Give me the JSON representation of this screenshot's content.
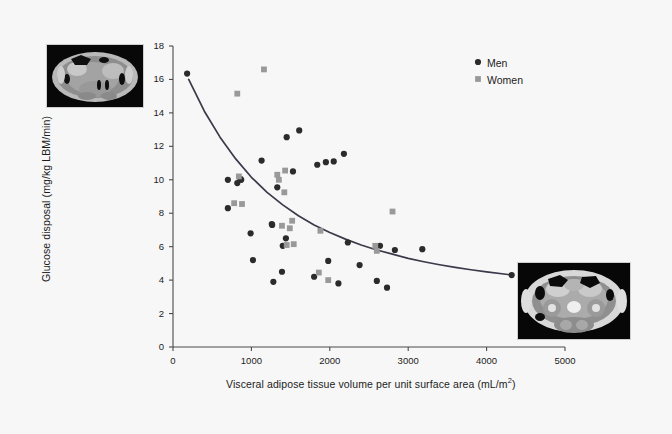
{
  "figure": {
    "background": "#f7f7f7",
    "men_color": "#2b2b2b",
    "women_color": "#999999",
    "curve_color": "#3a3a4a"
  },
  "images": [
    {
      "name": "ct-scan-abdominal-top",
      "caption": ""
    },
    {
      "name": "ct-scan-abdominal-bottom",
      "caption": ""
    }
  ],
  "chart_data": {
    "type": "scatter",
    "title": "",
    "xlabel_text": "Visceral adipose tissue volume per unit surface area (mL/m",
    "xlabel_sup": "2",
    "xlabel_tail": ")",
    "ylabel": "Glucose disposal (mg/kg LBM/min)",
    "xlim": [
      0,
      5000
    ],
    "ylim": [
      0,
      18
    ],
    "xticks": [
      0,
      1000,
      2000,
      3000,
      4000,
      5000
    ],
    "yticks": [
      0,
      2,
      4,
      6,
      8,
      10,
      12,
      14,
      16,
      18
    ],
    "xtick_labels": [
      "0",
      "1000",
      "2000",
      "3000",
      "4000",
      "5000"
    ],
    "ytick_labels": [
      "0",
      "2",
      "4",
      "6",
      "8",
      "10",
      "12",
      "14",
      "16",
      "18"
    ],
    "grid": false,
    "legend_position": "top-right",
    "series": [
      {
        "name": "Men",
        "marker": "circle",
        "color": "#2b2b2b",
        "points": [
          [
            180,
            16.35
          ],
          [
            700,
            10.0
          ],
          [
            700,
            8.3
          ],
          [
            820,
            9.8
          ],
          [
            860,
            10.05
          ],
          [
            870,
            10.0
          ],
          [
            990,
            6.8
          ],
          [
            1020,
            5.2
          ],
          [
            1130,
            11.15
          ],
          [
            1260,
            7.35
          ],
          [
            1265,
            7.3
          ],
          [
            1280,
            3.9
          ],
          [
            1330,
            9.55
          ],
          [
            1390,
            4.5
          ],
          [
            1400,
            6.05
          ],
          [
            1440,
            6.5
          ],
          [
            1450,
            12.55
          ],
          [
            1530,
            10.5
          ],
          [
            1610,
            12.95
          ],
          [
            1800,
            4.2
          ],
          [
            1840,
            10.9
          ],
          [
            1950,
            11.05
          ],
          [
            1980,
            5.15
          ],
          [
            2050,
            11.1
          ],
          [
            2110,
            3.8
          ],
          [
            2180,
            11.55
          ],
          [
            2230,
            6.25
          ],
          [
            2380,
            4.9
          ],
          [
            2600,
            3.95
          ],
          [
            2640,
            6.05
          ],
          [
            2730,
            3.55
          ],
          [
            2830,
            5.8
          ],
          [
            3180,
            5.85
          ],
          [
            4320,
            4.3
          ]
        ]
      },
      {
        "name": "Women",
        "marker": "square",
        "color": "#999999",
        "points": [
          [
            780,
            8.6
          ],
          [
            820,
            15.15
          ],
          [
            840,
            10.2
          ],
          [
            880,
            8.55
          ],
          [
            1160,
            16.6
          ],
          [
            1330,
            10.3
          ],
          [
            1350,
            10.0
          ],
          [
            1390,
            7.25
          ],
          [
            1420,
            9.25
          ],
          [
            1430,
            10.55
          ],
          [
            1450,
            6.1
          ],
          [
            1490,
            7.1
          ],
          [
            1520,
            7.55
          ],
          [
            1540,
            6.15
          ],
          [
            1880,
            6.95
          ],
          [
            1860,
            4.45
          ],
          [
            1980,
            4.0
          ],
          [
            2580,
            6.05
          ],
          [
            2600,
            5.75
          ],
          [
            2800,
            8.1
          ]
        ]
      }
    ],
    "fit_curve": {
      "name": "exponential-decay-fit",
      "color": "#3a3a4a",
      "points": [
        [
          200,
          16.0
        ],
        [
          400,
          14.1
        ],
        [
          600,
          12.55
        ],
        [
          800,
          11.25
        ],
        [
          1000,
          10.15
        ],
        [
          1200,
          9.25
        ],
        [
          1400,
          8.5
        ],
        [
          1600,
          7.85
        ],
        [
          1800,
          7.3
        ],
        [
          2000,
          6.85
        ],
        [
          2200,
          6.45
        ],
        [
          2400,
          6.1
        ],
        [
          2600,
          5.8
        ],
        [
          2800,
          5.55
        ],
        [
          3000,
          5.3
        ],
        [
          3200,
          5.1
        ],
        [
          3400,
          4.92
        ],
        [
          3600,
          4.76
        ],
        [
          3800,
          4.62
        ],
        [
          4000,
          4.49
        ],
        [
          4300,
          4.32
        ]
      ]
    },
    "legend": [
      {
        "label": "Men",
        "marker": "circle",
        "color": "#2b2b2b"
      },
      {
        "label": "Women",
        "marker": "square",
        "color": "#999999"
      }
    ]
  }
}
